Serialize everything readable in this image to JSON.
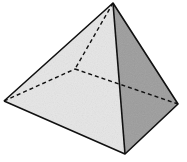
{
  "diagram": {
    "type": "square-pyramid",
    "vertices": {
      "apex": [
        113,
        3
      ],
      "left": [
        4,
        101
      ],
      "front": [
        125,
        154
      ],
      "right": [
        178,
        104
      ],
      "back_hidden": [
        75,
        69
      ]
    },
    "colors": {
      "left_face": "#e4e4e4",
      "right_face": "#9a9a9a",
      "edge": "#111111",
      "background": "#ffffff"
    }
  }
}
